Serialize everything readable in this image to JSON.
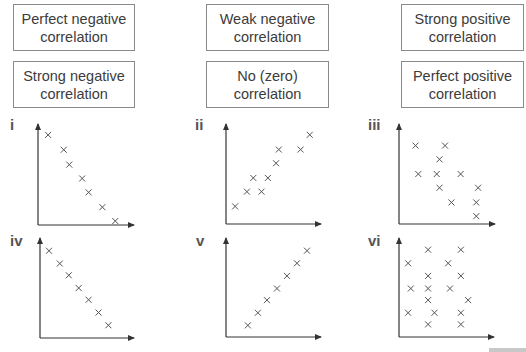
{
  "label_boxes": [
    {
      "id": "perfect-negative",
      "line1": "Perfect negative",
      "line2": "correlation"
    },
    {
      "id": "weak-negative",
      "line1": "Weak negative",
      "line2": "correlation"
    },
    {
      "id": "strong-positive",
      "line1": "Strong positive",
      "line2": "correlation"
    },
    {
      "id": "strong-negative",
      "line1": "Strong negative",
      "line2": "correlation"
    },
    {
      "id": "no-zero",
      "line1": "No (zero)",
      "line2": "correlation"
    },
    {
      "id": "perfect-positive",
      "line1": "Perfect positive",
      "line2": "correlation"
    }
  ],
  "graphs": [
    {
      "label": "i"
    },
    {
      "label": "ii"
    },
    {
      "label": "iii"
    },
    {
      "label": "iv"
    },
    {
      "label": "v"
    },
    {
      "label": "vi"
    }
  ],
  "colors": {
    "box_border": "#8a8a8a",
    "text": "#3c3c3c",
    "axis": "#333333",
    "marker": "#555555"
  },
  "chart_data": [
    {
      "type": "scatter",
      "title": "i",
      "xlabel": "",
      "ylabel": "",
      "grid": false,
      "marker": "x",
      "points": [
        [
          11,
          91
        ],
        [
          28,
          76
        ],
        [
          34,
          61
        ],
        [
          48,
          47
        ],
        [
          55,
          33
        ],
        [
          70,
          18
        ],
        [
          84,
          4
        ]
      ],
      "xlim": [
        0,
        100
      ],
      "ylim": [
        0,
        100
      ]
    },
    {
      "type": "scatter",
      "title": "ii",
      "xlabel": "",
      "ylabel": "",
      "grid": false,
      "marker": "x",
      "points": [
        [
          10,
          18
        ],
        [
          23,
          33
        ],
        [
          30,
          47
        ],
        [
          39,
          33
        ],
        [
          46,
          47
        ],
        [
          55,
          62
        ],
        [
          58,
          76
        ],
        [
          82,
          76
        ],
        [
          92,
          91
        ]
      ],
      "xlim": [
        0,
        100
      ],
      "ylim": [
        0,
        100
      ]
    },
    {
      "type": "scatter",
      "title": "iii",
      "xlabel": "",
      "ylabel": "",
      "grid": false,
      "marker": "x",
      "points": [
        [
          18,
          80
        ],
        [
          50,
          80
        ],
        [
          44,
          66
        ],
        [
          21,
          51
        ],
        [
          41,
          51
        ],
        [
          67,
          51
        ],
        [
          44,
          37
        ],
        [
          86,
          37
        ],
        [
          57,
          22
        ],
        [
          84,
          22
        ],
        [
          84,
          8
        ]
      ],
      "xlim": [
        0,
        100
      ],
      "ylim": [
        0,
        100
      ]
    },
    {
      "type": "scatter",
      "title": "iv",
      "xlabel": "",
      "ylabel": "",
      "grid": false,
      "marker": "x",
      "points": [
        [
          10,
          89
        ],
        [
          22,
          76
        ],
        [
          32,
          64
        ],
        [
          43,
          51
        ],
        [
          54,
          39
        ],
        [
          65,
          26
        ],
        [
          76,
          13
        ]
      ],
      "xlim": [
        0,
        100
      ],
      "ylim": [
        0,
        100
      ]
    },
    {
      "type": "scatter",
      "title": "v",
      "xlabel": "",
      "ylabel": "",
      "grid": false,
      "marker": "x",
      "points": [
        [
          24,
          12
        ],
        [
          35,
          25
        ],
        [
          45,
          38
        ],
        [
          56,
          50
        ],
        [
          67,
          63
        ],
        [
          78,
          76
        ],
        [
          89,
          89
        ]
      ],
      "xlim": [
        0,
        100
      ],
      "ylim": [
        0,
        100
      ]
    },
    {
      "type": "scatter",
      "title": "vi",
      "xlabel": "",
      "ylabel": "",
      "grid": false,
      "marker": "x",
      "points": [
        [
          32,
          90
        ],
        [
          68,
          90
        ],
        [
          10,
          76
        ],
        [
          54,
          76
        ],
        [
          32,
          63
        ],
        [
          68,
          63
        ],
        [
          13,
          50
        ],
        [
          32,
          50
        ],
        [
          56,
          50
        ],
        [
          32,
          38
        ],
        [
          76,
          38
        ],
        [
          10,
          25
        ],
        [
          39,
          25
        ],
        [
          68,
          25
        ],
        [
          32,
          13
        ],
        [
          68,
          13
        ]
      ],
      "xlim": [
        0,
        100
      ],
      "ylim": [
        0,
        100
      ]
    }
  ]
}
